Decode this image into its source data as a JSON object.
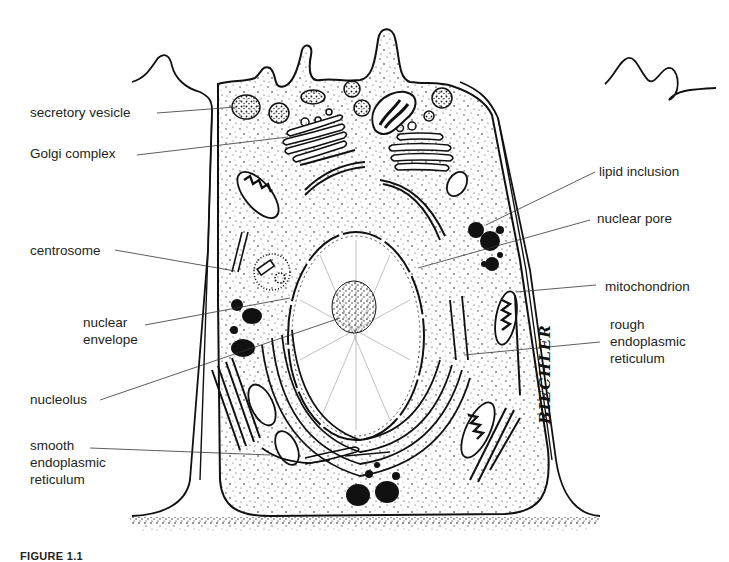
{
  "figure": {
    "type": "labeled-illustration",
    "colors": {
      "line": "#111111",
      "text": "#231f20",
      "background": "#ffffff"
    },
    "artist_signature": "BIECHLER",
    "caption_partial": "FIGURE 1.1"
  },
  "labels": {
    "left": [
      {
        "id": "secretory-vesicle",
        "lines": [
          "secretory vesicle"
        ]
      },
      {
        "id": "golgi-complex",
        "lines": [
          "Golgi complex"
        ]
      },
      {
        "id": "centrosome",
        "lines": [
          "centrosome"
        ]
      },
      {
        "id": "nuclear-envelope",
        "lines": [
          "nuclear",
          "envelope"
        ]
      },
      {
        "id": "nucleolus",
        "lines": [
          "nucleolus"
        ]
      },
      {
        "id": "smooth-er",
        "lines": [
          "smooth",
          "endoplasmic",
          "reticulum"
        ]
      }
    ],
    "right": [
      {
        "id": "lipid-inclusion",
        "lines": [
          "lipid inclusion"
        ]
      },
      {
        "id": "nuclear-pore",
        "lines": [
          "nuclear pore"
        ]
      },
      {
        "id": "mitochondrion",
        "lines": [
          "mitochondrion"
        ]
      },
      {
        "id": "rough-er",
        "lines": [
          "rough",
          "endoplasmic",
          "reticulum"
        ]
      }
    ]
  }
}
